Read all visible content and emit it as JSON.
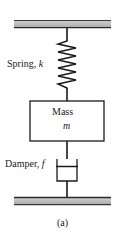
{
  "figure": {
    "caption": "(a)",
    "diagram_type": "mass-spring-damper schematic",
    "labels": {
      "spring": "Spring,",
      "spring_symbol": "k",
      "mass": "Mass",
      "mass_symbol": "m",
      "damper": "Damper,",
      "damper_symbol": "f"
    },
    "colors": {
      "ground_fill_light": "#d6d6d6",
      "ground_fill_dark": "#8c8c8c",
      "line": "#1a1a1a",
      "background": "#ffffff",
      "box_fill": "#ffffff"
    },
    "geometry": {
      "top_ground_y": 20,
      "top_ground_height": 8,
      "bottom_ground_y": 197,
      "bottom_ground_height": 8,
      "ground_x_start": 14,
      "ground_x_end": 111,
      "rod_x": 67,
      "spring_top_y": 41,
      "spring_bottom_y": 88,
      "spring_coils": 11,
      "spring_amplitude": 9,
      "mass_box_x": 30,
      "mass_box_y": 101,
      "mass_box_width": 74,
      "mass_box_height": 40,
      "damper_y": 159,
      "damper_height": 22,
      "damper_width": 20
    }
  }
}
